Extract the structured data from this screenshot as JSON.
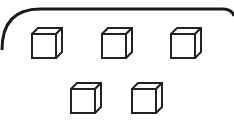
{
  "diagram": {
    "container": {
      "shape": "rounded-rectangle",
      "stroke": "#1a1a1a"
    },
    "cube_style": {
      "stroke": "#222222",
      "fill": "#ffffff"
    },
    "rows": [
      {
        "cube_count": 3
      },
      {
        "cube_count": 2
      }
    ],
    "total_cubes": 5
  }
}
